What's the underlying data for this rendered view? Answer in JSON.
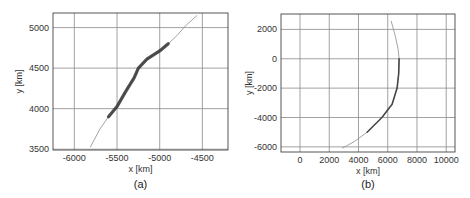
{
  "chart_data": [
    {
      "type": "line",
      "caption": "(a)",
      "title": "",
      "xlabel": "x [km]",
      "ylabel": "y [km]",
      "xlim": [
        -6250,
        -4200
      ],
      "ylim": [
        3490,
        5180
      ],
      "xticks": [
        -6000,
        -5500,
        -5000,
        -4500
      ],
      "yticks": [
        3500,
        4000,
        4500,
        5000
      ],
      "xtick_labels": [
        "-6000",
        "-5500",
        "-5000",
        "-4500"
      ],
      "ytick_labels": [
        "3500",
        "4000",
        "4500",
        "5000"
      ],
      "grid": true,
      "series": [
        {
          "name": "trajectory",
          "x": [
            -5813,
            -5700,
            -5600,
            -5500,
            -5400,
            -5300,
            -5250,
            -5150,
            -5000,
            -4900,
            -4800,
            -4700,
            -4562
          ],
          "y": [
            3525,
            3750,
            3900,
            4025,
            4210,
            4380,
            4500,
            4610,
            4712,
            4800,
            4900,
            5020,
            5150
          ],
          "thick_range": [
            -5650,
            -4850
          ]
        }
      ]
    },
    {
      "type": "line",
      "caption": "(b)",
      "title": "",
      "xlabel": "x [km]",
      "ylabel": "y [km]",
      "xlim": [
        -1300,
        10600
      ],
      "ylim": [
        -6350,
        3050
      ],
      "xticks": [
        0,
        2000,
        4000,
        6000,
        8000,
        10000
      ],
      "yticks": [
        -6000,
        -4000,
        -2000,
        0,
        2000
      ],
      "xtick_labels": [
        "0",
        "2000",
        "4000",
        "6000",
        "8000",
        "10000"
      ],
      "ytick_labels": [
        "-6000",
        "-4000",
        "-2000",
        "0",
        "2000"
      ],
      "grid": true,
      "series": [
        {
          "name": "trajectory",
          "x": [
            6230,
            6500,
            6700,
            6780,
            6750,
            6640,
            6300,
            5600,
            4590,
            3700,
            2880
          ],
          "y": [
            2580,
            1600,
            700,
            0,
            -1000,
            -2000,
            -3100,
            -4000,
            -5000,
            -5650,
            -6100
          ],
          "thick_range": [
            -5500,
            500
          ]
        }
      ]
    }
  ]
}
